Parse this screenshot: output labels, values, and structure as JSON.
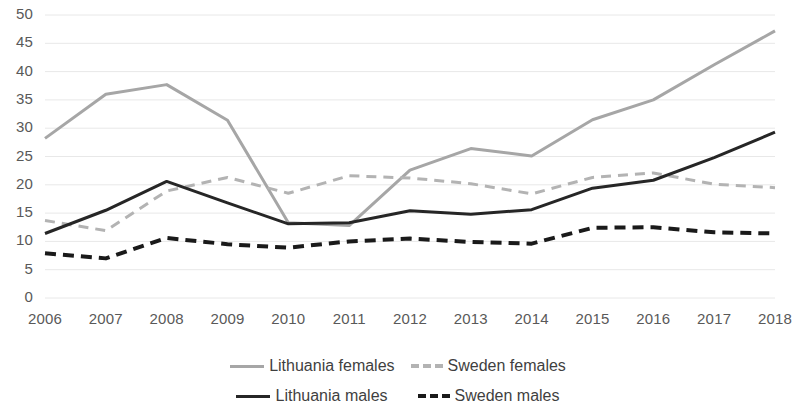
{
  "chart_data": {
    "type": "line",
    "title": "",
    "subtitle": "",
    "xlabel": "",
    "ylabel": "",
    "x": [
      2006,
      2007,
      2008,
      2009,
      2010,
      2011,
      2012,
      2013,
      2014,
      2015,
      2016,
      2017,
      2018
    ],
    "categories": [
      "2006",
      "2007",
      "2008",
      "2009",
      "2010",
      "2011",
      "2012",
      "2013",
      "2014",
      "2015",
      "2016",
      "2017",
      "2018"
    ],
    "xlim": [
      2006,
      2018
    ],
    "ylim": [
      0,
      50
    ],
    "y_ticks": [
      0,
      5,
      10,
      15,
      20,
      25,
      30,
      35,
      40,
      45,
      50
    ],
    "y_tick_labels": [
      "0",
      "5",
      "10",
      "15",
      "20",
      "25",
      "30",
      "35",
      "40",
      "45",
      "50"
    ],
    "grid": true,
    "grid_axis": "y",
    "legend_position": "bottom",
    "series": [
      {
        "name": "Lithuania females",
        "color": "#a6a6a6",
        "style": "solid",
        "width": 3,
        "values": [
          28.2,
          36.0,
          37.7,
          31.4,
          13.3,
          12.8,
          22.6,
          26.4,
          25.1,
          31.5,
          35.0,
          41.2,
          47.2
        ]
      },
      {
        "name": "Sweden females",
        "color": "#b3b3b3",
        "style": "dashed",
        "width": 3,
        "values": [
          13.7,
          11.9,
          18.9,
          21.3,
          18.5,
          21.6,
          21.2,
          20.2,
          18.4,
          21.3,
          22.1,
          20.1,
          19.5
        ]
      },
      {
        "name": "Lithuania males",
        "color": "#262626",
        "style": "solid",
        "width": 3,
        "values": [
          11.4,
          15.5,
          20.6,
          16.8,
          13.1,
          13.3,
          15.4,
          14.8,
          15.6,
          19.4,
          20.8,
          24.8,
          29.3
        ]
      },
      {
        "name": "Sweden males",
        "color": "#1a1a1a",
        "style": "dashed",
        "width": 4,
        "values": [
          7.9,
          7.0,
          10.6,
          9.5,
          8.9,
          10.0,
          10.5,
          9.9,
          9.6,
          12.4,
          12.5,
          11.6,
          11.4
        ]
      }
    ],
    "legend": [
      {
        "label": "Lithuania females",
        "color": "#a6a6a6",
        "style": "solid"
      },
      {
        "label": "Sweden females",
        "color": "#b3b3b3",
        "style": "dashed"
      },
      {
        "label": "Lithuania males",
        "color": "#262626",
        "style": "solid"
      },
      {
        "label": "Sweden males",
        "color": "#1a1a1a",
        "style": "dashed"
      }
    ]
  },
  "axis": {
    "gridline_color": "#e8e8e8",
    "tick_label_color": "#595959"
  }
}
